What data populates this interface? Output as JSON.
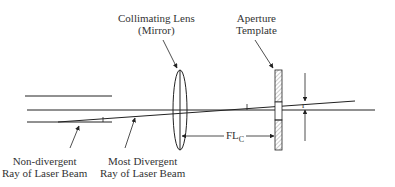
{
  "labels": {
    "lens_line1": "Collimating Lens",
    "lens_line2": "(Mirror)",
    "aperture_line1": "Aperture",
    "aperture_line2": "Template",
    "nondiv_line1": "Non-divergent",
    "nondiv_line2": "Ray of Laser Beam",
    "mostdiv_line1": "Most Divergent",
    "mostdiv_line2": "Ray of Laser Beam",
    "focal_length": "FL",
    "focal_length_sub": "C",
    "radius": "r"
  },
  "colors": {
    "line": "#222222",
    "hatch": "#999999"
  }
}
